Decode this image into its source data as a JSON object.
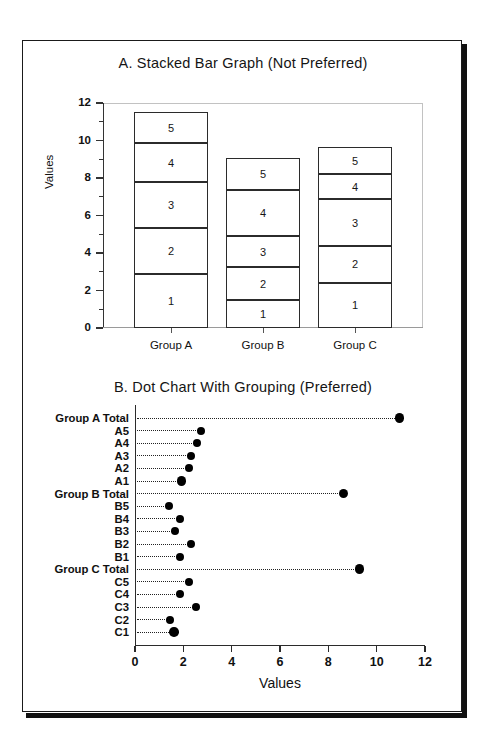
{
  "figure": {
    "background": "#ffffff",
    "frame_color": "#1a1a1a",
    "marker_color": "#000000"
  },
  "panel_a": {
    "title": "A. Stacked Bar Graph (Not Preferred)",
    "axis_title_y": "Values",
    "y_ticks": [
      "0",
      "2",
      "4",
      "6",
      "8",
      "10",
      "12"
    ],
    "category_labels": [
      "Group A",
      "Group B",
      "Group C"
    ],
    "segment_labels": [
      "1",
      "2",
      "3",
      "4",
      "5"
    ]
  },
  "panel_b": {
    "title": "B. Dot Chart With Grouping (Preferred)",
    "axis_title_x": "Values",
    "x_ticks": [
      "0",
      "2",
      "4",
      "6",
      "8",
      "10",
      "12"
    ],
    "row_labels": [
      "Group A Total",
      "A5",
      "A4",
      "A3",
      "A2",
      "A1",
      "Group B Total",
      "B5",
      "B4",
      "B3",
      "B2",
      "B1",
      "Group C Total",
      "C5",
      "C4",
      "C3",
      "C2",
      "C1"
    ]
  },
  "chart_data": [
    {
      "type": "bar",
      "title": "A. Stacked Bar Graph (Not Preferred)",
      "stacked": true,
      "xlabel": "",
      "ylabel": "Values",
      "ylim": [
        0,
        12
      ],
      "yticks": [
        0,
        2,
        4,
        6,
        8,
        10,
        12
      ],
      "grid": false,
      "legend": "none",
      "categories": [
        "Group A",
        "Group B",
        "Group C"
      ],
      "series": [
        {
          "name": "1",
          "values": [
            2.86,
            1.47,
            2.41
          ]
        },
        {
          "name": "2",
          "values": [
            2.46,
            1.78,
            1.96
          ]
        },
        {
          "name": "3",
          "values": [
            2.45,
            1.66,
            2.51
          ]
        },
        {
          "name": "4",
          "values": [
            2.09,
            2.45,
            1.32
          ]
        },
        {
          "name": "5",
          "values": [
            1.64,
            1.69,
            1.44
          ]
        }
      ],
      "totals": [
        11.5,
        9.05,
        9.64
      ]
    },
    {
      "type": "scatter",
      "subtype": "dot-chart",
      "title": "B. Dot Chart With Grouping (Preferred)",
      "xlabel": "Values",
      "ylabel": "",
      "xlim": [
        0,
        12
      ],
      "xticks": [
        0,
        2,
        4,
        6,
        8,
        10,
        12
      ],
      "grid": false,
      "legend": "none",
      "leader_lines": "dotted",
      "rows": [
        {
          "label": "Group A Total",
          "value": 10.95,
          "emphasis": true
        },
        {
          "label": "A5",
          "value": 2.75,
          "emphasis": false
        },
        {
          "label": "A4",
          "value": 2.57,
          "emphasis": false
        },
        {
          "label": "A3",
          "value": 2.33,
          "emphasis": false
        },
        {
          "label": "A2",
          "value": 2.23,
          "emphasis": false
        },
        {
          "label": "A1",
          "value": 1.92,
          "emphasis": true
        },
        {
          "label": "Group B Total",
          "value": 8.62,
          "emphasis": true
        },
        {
          "label": "B5",
          "value": 1.4,
          "emphasis": false
        },
        {
          "label": "B4",
          "value": 1.88,
          "emphasis": false
        },
        {
          "label": "B3",
          "value": 1.67,
          "emphasis": false
        },
        {
          "label": "B2",
          "value": 2.32,
          "emphasis": false
        },
        {
          "label": "B1",
          "value": 1.88,
          "emphasis": false
        },
        {
          "label": "Group C Total",
          "value": 9.28,
          "emphasis": true
        },
        {
          "label": "C5",
          "value": 2.24,
          "emphasis": false
        },
        {
          "label": "C4",
          "value": 1.87,
          "emphasis": false
        },
        {
          "label": "C3",
          "value": 2.53,
          "emphasis": false
        },
        {
          "label": "C2",
          "value": 1.44,
          "emphasis": false
        },
        {
          "label": "C1",
          "value": 1.62,
          "emphasis": true
        }
      ]
    }
  ]
}
